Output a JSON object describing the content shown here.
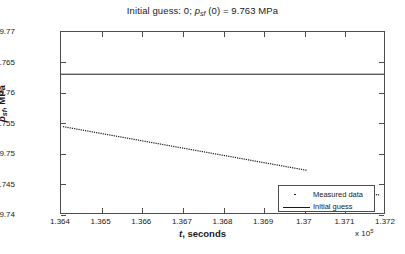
{
  "chart_data": {
    "type": "line",
    "title_parts": {
      "lead": "Initial guess: 0; ",
      "var": "p",
      "sub": "sf",
      "tail": " (0) = 9.763 MPa"
    },
    "xlabel": "t, seconds",
    "xlabel_var": "t",
    "xlabel_rest": ", seconds",
    "ylabel": "p_sf, MPa",
    "ylabel_var": "p",
    "ylabel_sub": "sf",
    "ylabel_rest": ", MPa",
    "x_multiplier": "x 10",
    "x_multiplier_exp": "5",
    "xlim": [
      136400,
      137200
    ],
    "ylim": [
      9.74,
      9.77
    ],
    "xticks": [
      1.364,
      1.365,
      1.366,
      1.367,
      1.368,
      1.369,
      1.37,
      1.371,
      1.372
    ],
    "xtick_labels": [
      "1.364",
      "1.365",
      "1.366",
      "1.367",
      "1.368",
      "1.369",
      "1.37",
      "1.371",
      "1.372"
    ],
    "yticks": [
      9.74,
      9.745,
      9.75,
      9.755,
      9.76,
      9.765,
      9.77
    ],
    "ytick_labels": [
      "9.74",
      "9.745",
      "9.75",
      "9.755",
      "9.76",
      "9.765",
      "9.77"
    ],
    "grid": false,
    "legend_position": "lower right",
    "series": [
      {
        "name": "Measured data",
        "style": "dotted",
        "color": "#1a1a1a",
        "segments": [
          {
            "x": [
              136405,
              136455,
              136505,
              136555,
              136605,
              136655,
              136705,
              136755,
              136805,
              136855,
              136905,
              136955,
              137005
            ],
            "y": [
              9.7544,
              9.7538,
              9.7532,
              9.7526,
              9.752,
              9.7514,
              9.7508,
              9.7502,
              9.7496,
              9.749,
              9.7484,
              9.7478,
              9.7472
            ]
          },
          {
            "x": [
              136940,
              136975,
              137010,
              137045
            ],
            "y": [
              9.7443,
              9.7441,
              9.7439,
              9.7437
            ]
          },
          {
            "x": [
              137155,
              137185
            ],
            "y": [
              9.7433,
              9.7431
            ]
          }
        ]
      },
      {
        "name": "Initial guess",
        "style": "solid",
        "color": "#1a1a1a",
        "value": 9.763
      }
    ],
    "legend_entries": [
      {
        "label": "Measured data",
        "symbol": "dot"
      },
      {
        "label": "Initial guess",
        "symbol": "line"
      }
    ]
  }
}
